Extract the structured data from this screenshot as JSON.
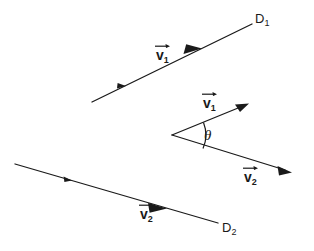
{
  "figure": {
    "background_color": "#ffffff",
    "stroke_color": "#1a1a1a",
    "width": 314,
    "height": 251,
    "labels": {
      "line1_name": "D",
      "line1_sub": "1",
      "line2_name": "D",
      "line2_sub": "2",
      "vector1_name": "v",
      "vector1_sub": "1",
      "vector2_name": "v",
      "vector2_sub": "2",
      "angle_symbol": "θ"
    },
    "elements": {
      "line_d1": {
        "label": "D₁",
        "from": [
          92,
          102
        ],
        "to": [
          252,
          24
        ],
        "direction": "up-right",
        "arrowheads": 2
      },
      "line_d2": {
        "label": "D₂",
        "from": [
          15,
          164
        ],
        "to": [
          218,
          223
        ],
        "direction": "down-right",
        "arrowheads": 2
      },
      "angle_figure": {
        "vertex": [
          172,
          135
        ],
        "ray_v1_tip": [
          248,
          104
        ],
        "ray_v2_tip": [
          290,
          172
        ],
        "arc_label": "θ"
      }
    }
  }
}
